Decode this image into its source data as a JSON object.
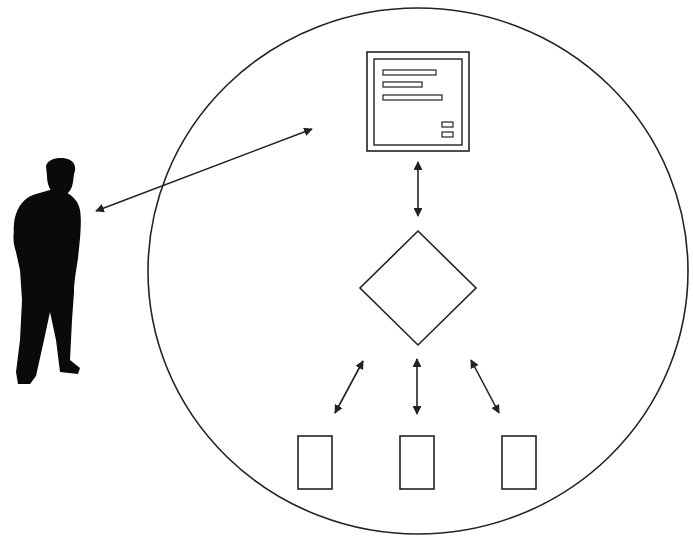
{
  "diagram": {
    "colors": {
      "stroke": "#222222",
      "fill": "#ffffff",
      "silhouette": "#0a0a0a",
      "background": "#ffffff"
    },
    "nodes": [
      {
        "id": "user",
        "kind": "person-silhouette",
        "label": "User"
      },
      {
        "id": "system-boundary",
        "kind": "ellipse",
        "label": "System"
      },
      {
        "id": "interface",
        "kind": "window",
        "label": "User interface screen",
        "text_lines": 3,
        "buttons": 2
      },
      {
        "id": "decision",
        "kind": "diamond",
        "label": "Decision / control logic"
      },
      {
        "id": "component-1",
        "kind": "rectangle",
        "label": "Component 1"
      },
      {
        "id": "component-2",
        "kind": "rectangle",
        "label": "Component 2"
      },
      {
        "id": "component-3",
        "kind": "rectangle",
        "label": "Component 3"
      }
    ],
    "edges": [
      {
        "from": "user",
        "to": "interface",
        "type": "bidirectional-arrow"
      },
      {
        "from": "interface",
        "to": "decision",
        "type": "bidirectional-arrow"
      },
      {
        "from": "decision",
        "to": "component-1",
        "type": "bidirectional-arrow"
      },
      {
        "from": "decision",
        "to": "component-2",
        "type": "bidirectional-arrow"
      },
      {
        "from": "decision",
        "to": "component-3",
        "type": "bidirectional-arrow"
      }
    ]
  }
}
